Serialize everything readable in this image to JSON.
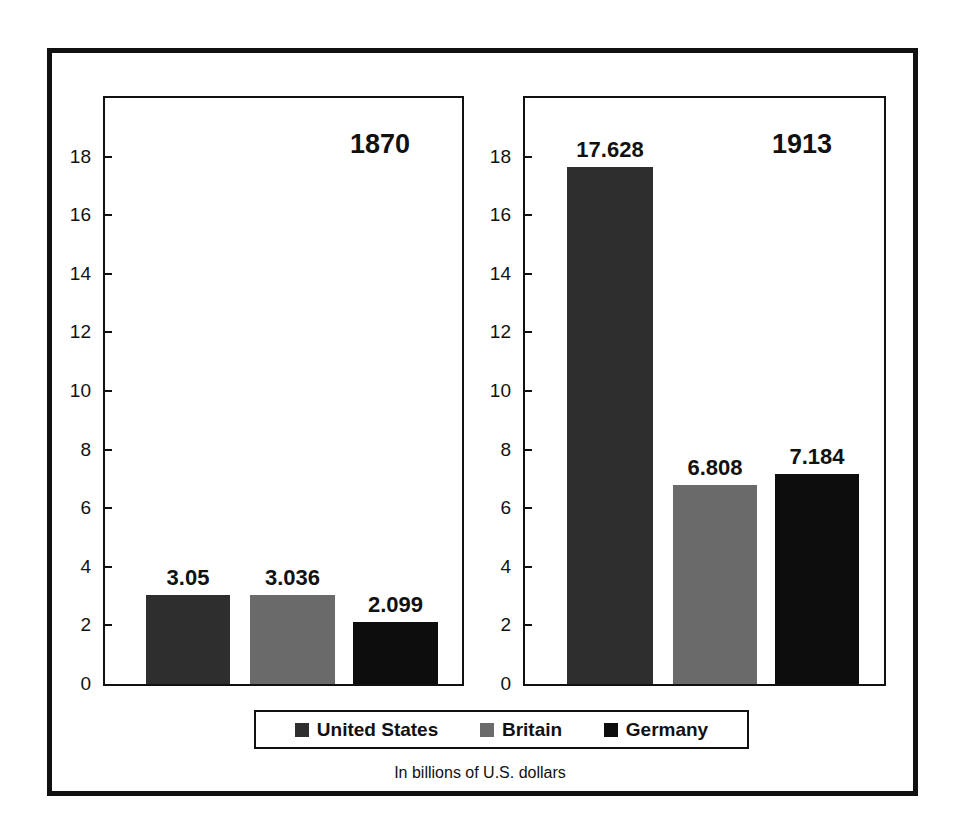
{
  "chart_data": [
    {
      "type": "bar",
      "title": "1870",
      "categories": [
        "United States",
        "Britain",
        "Germany"
      ],
      "values": [
        3.05,
        3.036,
        2.099
      ],
      "data_labels": [
        "3.05",
        "3.036",
        "2.099"
      ],
      "xlabel": "",
      "ylabel": "",
      "ylim": [
        0,
        20
      ],
      "yticks": [
        0,
        2,
        4,
        6,
        8,
        10,
        12,
        14,
        16,
        18
      ],
      "grid": false
    },
    {
      "type": "bar",
      "title": "1913",
      "categories": [
        "United States",
        "Britain",
        "Germany"
      ],
      "values": [
        17.628,
        6.808,
        7.184
      ],
      "data_labels": [
        "17.628",
        "6.808",
        "7.184"
      ],
      "xlabel": "",
      "ylabel": "",
      "ylim": [
        0,
        20
      ],
      "yticks": [
        0,
        2,
        4,
        6,
        8,
        10,
        12,
        14,
        16,
        18
      ],
      "grid": false
    }
  ],
  "legend": {
    "position": "bottom",
    "items": [
      {
        "label": "United States",
        "color": "#2e2e2e"
      },
      {
        "label": "Britain",
        "color": "#6a6a6a"
      },
      {
        "label": "Germany",
        "color": "#0d0d0d"
      }
    ]
  },
  "note": "In billions of U.S. dollars",
  "panels": {
    "left": {
      "year": "1870"
    },
    "right": {
      "year": "1913"
    }
  },
  "yticks": [
    "18",
    "16",
    "14",
    "12",
    "10",
    "8",
    "6",
    "4",
    "2",
    "0"
  ]
}
